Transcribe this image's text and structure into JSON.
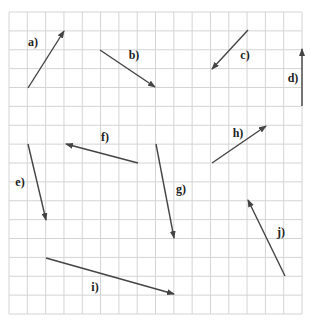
{
  "diagram": {
    "type": "vector-grid",
    "grid": {
      "x0": 9,
      "y0": 12,
      "x1": 302,
      "y1": 314,
      "cols": 16,
      "rows": 16,
      "line_color": "#d4d4d4",
      "border_color": "#cccccc"
    },
    "arrow_color": "#444444",
    "vectors": [
      {
        "id": "a",
        "label": "a)",
        "tail": [
          28,
          88
        ],
        "head": [
          64,
          31
        ],
        "label_pos": [
          33,
          42
        ]
      },
      {
        "id": "b",
        "label": "b)",
        "tail": [
          100,
          50
        ],
        "head": [
          155,
          87
        ],
        "label_pos": [
          134,
          55
        ]
      },
      {
        "id": "c",
        "label": "c)",
        "tail": [
          248,
          30
        ],
        "head": [
          212,
          69
        ],
        "label_pos": [
          245,
          55
        ]
      },
      {
        "id": "d",
        "label": "d)",
        "tail": [
          302,
          106
        ],
        "head": [
          302,
          49
        ],
        "label_pos": [
          293,
          78
        ]
      },
      {
        "id": "e",
        "label": "e)",
        "tail": [
          28,
          144
        ],
        "head": [
          46,
          220
        ],
        "label_pos": [
          20,
          182
        ]
      },
      {
        "id": "f",
        "label": "f)",
        "tail": [
          138,
          163
        ],
        "head": [
          66,
          144
        ],
        "label_pos": [
          105,
          137
        ]
      },
      {
        "id": "g",
        "label": "g)",
        "tail": [
          156,
          144
        ],
        "head": [
          174,
          238
        ],
        "label_pos": [
          181,
          189
        ]
      },
      {
        "id": "h",
        "label": "h)",
        "tail": [
          212,
          163
        ],
        "head": [
          266,
          126
        ],
        "label_pos": [
          238,
          133
        ]
      },
      {
        "id": "i",
        "label": "i)",
        "tail": [
          46,
          258
        ],
        "head": [
          174,
          294
        ],
        "label_pos": [
          95,
          287
        ]
      },
      {
        "id": "j",
        "label": "j)",
        "tail": [
          285,
          276
        ],
        "head": [
          248,
          200
        ],
        "label_pos": [
          281,
          232
        ]
      }
    ]
  }
}
